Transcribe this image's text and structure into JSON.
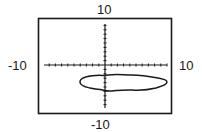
{
  "chart_data": {
    "type": "line",
    "title": "",
    "xlabel": "",
    "ylabel": "",
    "xlim": [
      -10,
      10
    ],
    "ylim": [
      -10,
      10
    ],
    "grid": false,
    "tick_spacing": 1,
    "window_labels": {
      "ymax": "10",
      "ymin": "-10",
      "xmin": "-10",
      "xmax": "10"
    },
    "series": [
      {
        "name": "closed curve",
        "kind": "closed-curve",
        "description": "horizontally elongated ellipse-like closed curve below the x-axis",
        "x_range": [
          -3.7,
          9.2
        ],
        "y_range": [
          -5.4,
          -1.9
        ],
        "center": [
          2.8,
          -3.6
        ]
      }
    ]
  },
  "colors": {
    "ink": "#1a1a1a",
    "background": "#ffffff"
  }
}
